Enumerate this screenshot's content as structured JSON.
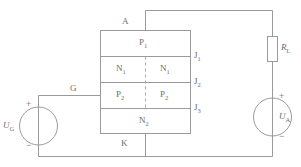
{
  "diagram": {
    "stroke_color": "#9a9a9a",
    "dash_color": "#a8a8a8",
    "text_color": "#6e6e6e",
    "background": "#ffffff"
  },
  "terminals": {
    "anode": "A",
    "gate": "G",
    "cathode": "K"
  },
  "layers": [
    {
      "name": "P1",
      "base": "P",
      "sub": "1",
      "split": false
    },
    {
      "name": "N1",
      "base": "N",
      "sub": "1",
      "split": true
    },
    {
      "name": "P2",
      "base": "P",
      "sub": "2",
      "split": true
    },
    {
      "name": "N2",
      "base": "N",
      "sub": "2",
      "split": false
    }
  ],
  "junctions": [
    {
      "base": "J",
      "sub": "1"
    },
    {
      "base": "J",
      "sub": "2"
    },
    {
      "base": "J",
      "sub": "3"
    }
  ],
  "components": {
    "resistor": {
      "base": "R",
      "sub": "L",
      "kind": "resistor-box"
    },
    "source_gate": {
      "base": "U",
      "sub": "G",
      "kind": "voltage-source-circle"
    },
    "source_anode": {
      "base": "U",
      "sub": "A",
      "kind": "voltage-source-circle"
    }
  },
  "polarity": {
    "plus": "+",
    "minus": "−"
  }
}
